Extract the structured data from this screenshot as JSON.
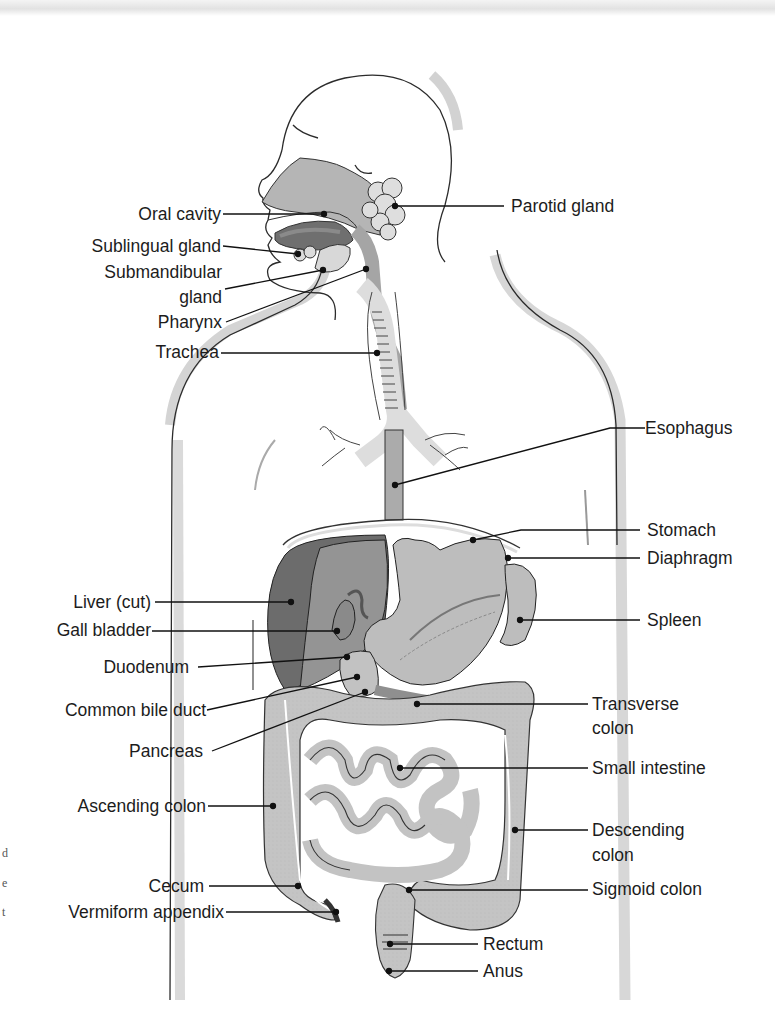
{
  "figure": {
    "colors": {
      "organ_light": "#c9c9c9",
      "organ_mid": "#a9a9a9",
      "organ_dark": "#6e6e6e",
      "outline": "#2b2b2b",
      "body_shadow": "#d7d7d7",
      "leader_line": "#111111"
    }
  },
  "labels_left": [
    {
      "id": "oral-cavity",
      "text": "Oral cavity"
    },
    {
      "id": "sublingual-gland",
      "text": "Sublingual gland"
    },
    {
      "id": "submandibular-gland-1",
      "text": "Submandibular"
    },
    {
      "id": "submandibular-gland-2",
      "text": "gland"
    },
    {
      "id": "pharynx",
      "text": "Pharynx"
    },
    {
      "id": "trachea",
      "text": "Trachea"
    },
    {
      "id": "liver",
      "text": "Liver (cut)"
    },
    {
      "id": "gall-bladder",
      "text": "Gall bladder"
    },
    {
      "id": "duodenum",
      "text": "Duodenum"
    },
    {
      "id": "common-bile-duct",
      "text": "Common bile duct"
    },
    {
      "id": "pancreas",
      "text": "Pancreas"
    },
    {
      "id": "ascending-colon",
      "text": "Ascending colon"
    },
    {
      "id": "cecum",
      "text": "Cecum"
    },
    {
      "id": "vermiform-appendix",
      "text": "Vermiform appendix"
    }
  ],
  "labels_right": [
    {
      "id": "parotid-gland",
      "text": "Parotid gland"
    },
    {
      "id": "esophagus",
      "text": "Esophagus"
    },
    {
      "id": "stomach",
      "text": "Stomach"
    },
    {
      "id": "diaphragm",
      "text": "Diaphragm"
    },
    {
      "id": "spleen",
      "text": "Spleen"
    },
    {
      "id": "transverse-colon-1",
      "text": "Transverse"
    },
    {
      "id": "transverse-colon-2",
      "text": "colon"
    },
    {
      "id": "small-intestine",
      "text": "Small intestine"
    },
    {
      "id": "descending-colon-1",
      "text": "Descending"
    },
    {
      "id": "descending-colon-2",
      "text": "colon"
    },
    {
      "id": "sigmoid-colon",
      "text": "Sigmoid colon"
    },
    {
      "id": "rectum",
      "text": "Rectum"
    },
    {
      "id": "anus",
      "text": "Anus"
    }
  ],
  "edge_fragments": [
    "d",
    "e",
    "t"
  ]
}
